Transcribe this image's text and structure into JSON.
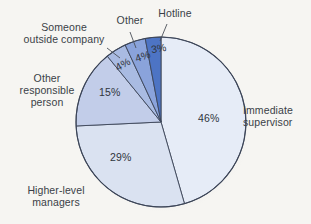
{
  "background_color": "#f6f5f2",
  "chart_data": {
    "type": "pie",
    "title": "",
    "subtitle": "",
    "xlabel": "",
    "ylabel": "",
    "legend_position": "external-callout-labels",
    "grid": false,
    "total": 101,
    "units": "percent",
    "start_angle_deg": 0,
    "direction": "clockwise",
    "categories": [
      "Immediate supervisor",
      "Higher-level managers",
      "Other responsible person",
      "Someone outside company",
      "Other",
      "Hotline"
    ],
    "values": [
      46,
      29,
      15,
      4,
      4,
      3
    ],
    "value_labels": [
      "46%",
      "29%",
      "15%",
      "4%",
      "4%",
      "3%"
    ],
    "colors": [
      "#e6ecf7",
      "#dae2f1",
      "#c2cde9",
      "#a9bbe2",
      "#8aa3db",
      "#4d74c4"
    ],
    "slices": [
      {
        "label": "Immediate supervisor",
        "value": 46,
        "value_label": "46%",
        "color": "#e6ecf7"
      },
      {
        "label": "Higher-level managers",
        "value": 29,
        "value_label": "29%",
        "color": "#dae2f1"
      },
      {
        "label": "Other responsible person",
        "value": 15,
        "value_label": "15%",
        "color": "#c2cde9"
      },
      {
        "label": "Someone outside company",
        "value": 4,
        "value_label": "4%",
        "color": "#a9bbe2"
      },
      {
        "label": "Other",
        "value": 4,
        "value_label": "4%",
        "color": "#8aa3db"
      },
      {
        "label": "Hotline",
        "value": 3,
        "value_label": "3%",
        "color": "#4d74c4"
      }
    ]
  },
  "labels": {
    "someone_outside_company": "Someone\noutside company",
    "other": "Other",
    "hotline": "Hotline",
    "other_responsible_person": "Other\nresponsible\nperson",
    "higher_level_managers": "Higher-level\nmanagers",
    "immediate_supervisor": "Immediate\nsupervisor"
  },
  "values": {
    "immediate_supervisor": "46%",
    "higher_level_managers": "29%",
    "other_responsible_person": "15%",
    "someone_outside_company": "4%",
    "other": "4%",
    "hotline": "3%"
  },
  "style": {
    "text_color": "#3a3f47",
    "outline_color": "#3c4558",
    "leader_line_color": "#4a4f58"
  }
}
